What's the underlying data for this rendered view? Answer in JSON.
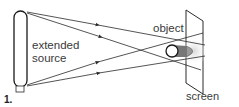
{
  "figure": {
    "number": "1.",
    "labels": {
      "source_line1": "extended",
      "source_line2": "source",
      "object": "object",
      "screen": "screen"
    },
    "colors": {
      "line": "#2a2a2a",
      "shadow_dark": "#6e6e6e",
      "penumbra": "#e6e6e6",
      "background": "#ffffff"
    }
  }
}
